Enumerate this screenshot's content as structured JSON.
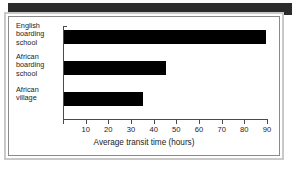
{
  "chart_data": {
    "type": "bar",
    "orientation": "horizontal",
    "title": "",
    "subtitle": "",
    "xlabel": "Average transit time (hours)",
    "ylabel": "",
    "categories": [
      "English boarding school",
      "African boarding school",
      "African village"
    ],
    "values": [
      89,
      45,
      35
    ],
    "series": [
      {
        "name": "Average transit time",
        "values": [
          89,
          45,
          35
        ]
      }
    ],
    "xlim": [
      0,
      90
    ],
    "xticks": [
      10,
      20,
      30,
      40,
      50,
      60,
      70,
      80,
      90
    ],
    "xtick_labels": [
      "10",
      "20",
      "30",
      "40",
      "50",
      "60",
      "70",
      "80",
      "90"
    ],
    "grid": false,
    "legend": false,
    "legend_position": "none",
    "bar_color": "#000000",
    "axis_color": "#4a4a4a",
    "background_color": "#ffffff"
  },
  "figure": {
    "frame_color": "#c9c9c9",
    "inner_rule_color": "#8a8a8a",
    "header_band_color": "#2b2b2b",
    "caption_fragment": ""
  },
  "category_labels": [
    {
      "lines": [
        "English",
        "boarding",
        "school"
      ],
      "text": "English boarding school"
    },
    {
      "lines": [
        "African",
        "boarding",
        "school"
      ],
      "text": "African boarding school"
    },
    {
      "lines": [
        "African",
        "village"
      ],
      "text": "African village"
    }
  ]
}
